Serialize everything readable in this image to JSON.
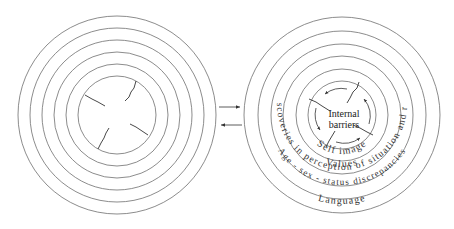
{
  "diagram": {
    "left_circle": {
      "label": "",
      "ring_count": 6
    },
    "right_circle": {
      "center_label_line1": "Internal",
      "center_label_line2": "barriers",
      "rings": [
        {
          "label": "Self image"
        },
        {
          "label": "Values"
        },
        {
          "label": "Discoveries in perception of situation and role"
        },
        {
          "label": "Age - sex - status discrepancies"
        },
        {
          "label": "Language"
        }
      ]
    },
    "connectors": {
      "top_arrow": "arrow-right",
      "bottom_arrow": "arrow-left"
    },
    "colors": {
      "ring_stroke": "#6e6e6e",
      "text": "#333333",
      "background": "#ffffff"
    }
  }
}
